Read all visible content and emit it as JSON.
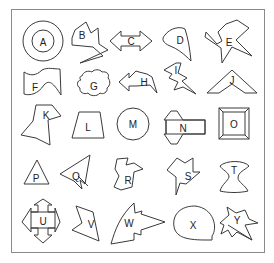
{
  "grid": {
    "rows": 5,
    "cols": 5
  },
  "colors": {
    "stroke": "#3a3a3a",
    "frame": "#8a8a8a",
    "background": "#ffffff"
  },
  "shapes": [
    {
      "label": "A",
      "kind": "concentric circles",
      "row": 0,
      "col": 0
    },
    {
      "label": "B",
      "kind": "irregular zigzag polygon",
      "row": 0,
      "col": 1
    },
    {
      "label": "C",
      "kind": "double-headed arrow",
      "row": 0,
      "col": 2
    },
    {
      "label": "D",
      "kind": "teardrop",
      "row": 0,
      "col": 3
    },
    {
      "label": "E",
      "kind": "irregular X shape",
      "row": 0,
      "col": 4
    },
    {
      "label": "F",
      "kind": "wavy banner",
      "row": 1,
      "col": 0
    },
    {
      "label": "G",
      "kind": "cloud",
      "row": 1,
      "col": 1
    },
    {
      "label": "H",
      "kind": "bent arrow",
      "row": 1,
      "col": 2
    },
    {
      "label": "I",
      "kind": "lightning bolt",
      "row": 1,
      "col": 3
    },
    {
      "label": "J",
      "kind": "chevron roof",
      "row": 1,
      "col": 4
    },
    {
      "label": "K",
      "kind": "irregular hexagon",
      "row": 2,
      "col": 0
    },
    {
      "label": "L",
      "kind": "trapezoid",
      "row": 2,
      "col": 1
    },
    {
      "label": "M",
      "kind": "circle",
      "row": 2,
      "col": 2
    },
    {
      "label": "N",
      "kind": "rectangle with diamond",
      "row": 2,
      "col": 3
    },
    {
      "label": "O",
      "kind": "bevelled square frame",
      "row": 2,
      "col": 4
    },
    {
      "label": "P",
      "kind": "triangle",
      "row": 3,
      "col": 0
    },
    {
      "label": "Q",
      "kind": "arrowhead triangle",
      "row": 3,
      "col": 1
    },
    {
      "label": "R",
      "kind": "bird-like shape",
      "row": 3,
      "col": 2
    },
    {
      "label": "S",
      "kind": "irregular star",
      "row": 3,
      "col": 3
    },
    {
      "label": "T",
      "kind": "hourglass vase",
      "row": 3,
      "col": 4
    },
    {
      "label": "U",
      "kind": "four-way arrow cross",
      "row": 4,
      "col": 0
    },
    {
      "label": "V",
      "kind": "notched quadrilateral",
      "row": 4,
      "col": 1
    },
    {
      "label": "W",
      "kind": "zigzag arrow",
      "row": 4,
      "col": 2
    },
    {
      "label": "X",
      "kind": "speech bubble",
      "row": 4,
      "col": 3
    },
    {
      "label": "Y",
      "kind": "explosion star",
      "row": 4,
      "col": 4
    }
  ]
}
